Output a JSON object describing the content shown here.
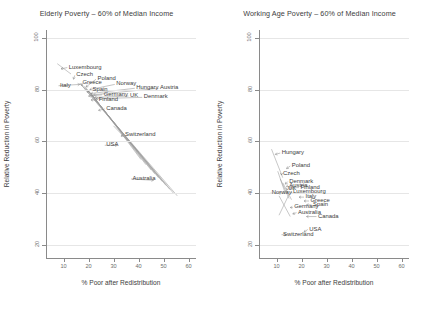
{
  "figure": {
    "background": "#ffffff",
    "axis_color": "#8a8a8a",
    "grid_color": "#e6e6e6",
    "text_color": "#3c3c3c",
    "marker_color": "#7a7a7a",
    "connector_color": "#9a9a9a"
  },
  "charts": [
    {
      "id": "elderly",
      "title": "Elderly Poverty – 60% of Median Income",
      "xlabel": "% Poor after Redistribution",
      "ylabel": "Relative Reduction in Poverty",
      "xticks": [
        10,
        20,
        30,
        40,
        50,
        60
      ],
      "yticks": [
        20,
        40,
        60,
        80,
        100
      ],
      "xlim": [
        3,
        63
      ],
      "ylim": [
        15,
        103
      ],
      "grid": "horizontal",
      "points": [
        {
          "label": "Luxembourg",
          "x": 9.0,
          "y": 88.0,
          "lx": 11.5,
          "ly": 88.5
        },
        {
          "label": "Czech",
          "x": 14.0,
          "y": 84.0,
          "lx": 14.5,
          "ly": 85.5
        },
        {
          "label": "Italy",
          "x": 16.5,
          "y": 82.0,
          "lx": 8.0,
          "ly": 81.5
        },
        {
          "label": "Greece",
          "x": 17.5,
          "y": 81.5,
          "lx": 17.0,
          "ly": 82.5
        },
        {
          "label": "Poland",
          "x": 19.0,
          "y": 81.0,
          "lx": 23.0,
          "ly": 84.0
        },
        {
          "label": "Norway",
          "x": 20.5,
          "y": 80.0,
          "lx": 30.5,
          "ly": 82.0
        },
        {
          "label": "Spain",
          "x": 19.5,
          "y": 79.0,
          "lx": 21.0,
          "ly": 80.0
        },
        {
          "label": "Hungary",
          "x": 21.0,
          "y": 78.5,
          "lx": 38.5,
          "ly": 80.5
        },
        {
          "label": "Austria",
          "x": 22.0,
          "y": 78.0,
          "lx": 48.0,
          "ly": 80.5
        },
        {
          "label": "Germany",
          "x": 20.0,
          "y": 77.5,
          "lx": 25.5,
          "ly": 78.0
        },
        {
          "label": "UK",
          "x": 22.5,
          "y": 77.0,
          "lx": 36.0,
          "ly": 77.5
        },
        {
          "label": "Denmark",
          "x": 23.0,
          "y": 76.5,
          "lx": 41.5,
          "ly": 77.0
        },
        {
          "label": "Finland",
          "x": 21.0,
          "y": 76.0,
          "lx": 23.5,
          "ly": 76.0
        },
        {
          "label": "Canada",
          "x": 24.0,
          "y": 72.0,
          "lx": 26.5,
          "ly": 72.5
        },
        {
          "label": "Switzerland",
          "x": 33.0,
          "y": 62.0,
          "lx": 34.0,
          "ly": 62.5
        },
        {
          "label": "USA",
          "x": 31.5,
          "y": 58.5,
          "lx": 26.5,
          "ly": 58.5
        },
        {
          "label": "Australia",
          "x": 46.0,
          "y": 45.0,
          "lx": 37.0,
          "ly": 45.5
        }
      ],
      "lines": [
        {
          "x1": 7.5,
          "y1": 90.0,
          "x2": 13.0,
          "y2": 86.0
        },
        {
          "x1": 16.5,
          "y1": 82.5,
          "x2": 55.5,
          "y2": 39.0
        },
        {
          "x1": 17.0,
          "y1": 82.0,
          "x2": 54.0,
          "y2": 40.0
        },
        {
          "x1": 18.0,
          "y1": 81.5,
          "x2": 52.5,
          "y2": 41.5
        },
        {
          "x1": 18.5,
          "y1": 81.0,
          "x2": 51.0,
          "y2": 43.0
        },
        {
          "x1": 19.0,
          "y1": 80.5,
          "x2": 49.5,
          "y2": 44.5
        },
        {
          "x1": 19.5,
          "y1": 80.0,
          "x2": 48.0,
          "y2": 46.0
        },
        {
          "x1": 20.0,
          "y1": 79.5,
          "x2": 46.5,
          "y2": 47.5
        },
        {
          "x1": 20.5,
          "y1": 79.0,
          "x2": 45.0,
          "y2": 49.0
        },
        {
          "x1": 21.0,
          "y1": 78.5,
          "x2": 43.0,
          "y2": 51.0
        },
        {
          "x1": 21.5,
          "y1": 78.0,
          "x2": 41.0,
          "y2": 53.0
        },
        {
          "x1": 30.0,
          "y1": 66.0,
          "x2": 40.0,
          "y2": 56.0
        }
      ]
    },
    {
      "id": "workingage",
      "title": "Working Age Poverty – 60% of Median Income",
      "xlabel": "% Poor after Redistribution",
      "ylabel": "Relative Reduction in Poverty",
      "xticks": [
        10,
        20,
        30,
        40,
        50,
        60
      ],
      "yticks": [
        20,
        40,
        60,
        80,
        100
      ],
      "xlim": [
        3,
        63
      ],
      "ylim": [
        15,
        103
      ],
      "grid": "horizontal",
      "points": [
        {
          "label": "Hungary",
          "x": 9.5,
          "y": 55.0,
          "lx": 11.5,
          "ly": 55.5
        },
        {
          "label": "Poland",
          "x": 14.0,
          "y": 49.5,
          "lx": 15.5,
          "ly": 50.5
        },
        {
          "label": "Czech",
          "x": 12.0,
          "y": 47.0,
          "lx": 12.0,
          "ly": 47.5
        },
        {
          "label": "Denmark",
          "x": 13.5,
          "y": 43.5,
          "lx": 14.5,
          "ly": 44.5
        },
        {
          "label": "Austria",
          "x": 14.0,
          "y": 42.5,
          "lx": 14.5,
          "ly": 42.8
        },
        {
          "label": "UK",
          "x": 14.5,
          "y": 41.5,
          "lx": 14.0,
          "ly": 41.5
        },
        {
          "label": "Finland",
          "x": 15.0,
          "y": 42.0,
          "lx": 19.0,
          "ly": 42.2
        },
        {
          "label": "Norway",
          "x": 12.0,
          "y": 40.0,
          "lx": 7.5,
          "ly": 40.0
        },
        {
          "label": "Luxembourg",
          "x": 16.0,
          "y": 40.5,
          "lx": 16.0,
          "ly": 40.3
        },
        {
          "label": "Italy",
          "x": 19.0,
          "y": 38.5,
          "lx": 21.0,
          "ly": 38.5
        },
        {
          "label": "Greece",
          "x": 21.0,
          "y": 37.0,
          "lx": 23.0,
          "ly": 37.0
        },
        {
          "label": "Spain",
          "x": 22.0,
          "y": 35.5,
          "lx": 24.0,
          "ly": 35.5
        },
        {
          "label": "Germany",
          "x": 15.5,
          "y": 34.5,
          "lx": 16.5,
          "ly": 34.5
        },
        {
          "label": "Australia",
          "x": 16.5,
          "y": 32.0,
          "lx": 18.0,
          "ly": 32.5
        },
        {
          "label": "Canada",
          "x": 22.0,
          "y": 31.0,
          "lx": 26.0,
          "ly": 31.0
        },
        {
          "label": "USA",
          "x": 21.0,
          "y": 25.0,
          "lx": 22.5,
          "ly": 26.0
        },
        {
          "label": "Switzerland",
          "x": 14.0,
          "y": 24.0,
          "lx": 12.0,
          "ly": 24.0
        }
      ],
      "lines": [
        {
          "x1": 8.0,
          "y1": 57.0,
          "x2": 12.5,
          "y2": 46.0
        },
        {
          "x1": 10.5,
          "y1": 48.5,
          "x2": 13.5,
          "y2": 40.0
        },
        {
          "x1": 11.5,
          "y1": 45.5,
          "x2": 15.0,
          "y2": 38.0
        },
        {
          "x1": 12.5,
          "y1": 44.0,
          "x2": 16.0,
          "y2": 37.5
        },
        {
          "x1": 11.0,
          "y1": 39.0,
          "x2": 15.5,
          "y2": 31.0
        },
        {
          "x1": 15.0,
          "y1": 39.5,
          "x2": 11.0,
          "y2": 31.5
        }
      ]
    }
  ]
}
